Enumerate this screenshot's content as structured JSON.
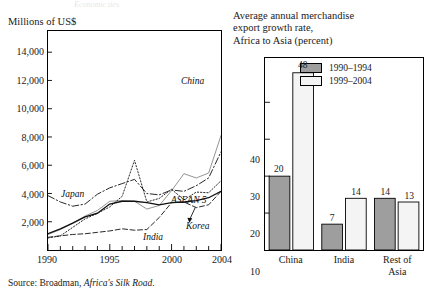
{
  "bleed_text": "Economic ties",
  "left": {
    "units_label": "Millions of US$",
    "xticks": [
      "1990",
      "1995",
      "2000",
      "2004"
    ],
    "yticks": [
      "14,000",
      "12,000",
      "10,000",
      "8,000",
      "6,000",
      "4,000",
      "2,000"
    ],
    "series_labels": {
      "china": "China",
      "japan": "Japan",
      "asean": "ASEAN 5",
      "india": "India",
      "korea": "Korea"
    }
  },
  "right": {
    "title_line1": "Average annual merchandise",
    "title_line2": "export growth rate,",
    "title_line3": "Africa to Asia (percent)",
    "yticks": [
      "40",
      "30",
      "20",
      "10"
    ],
    "legend": [
      {
        "label": "1990–1994",
        "color": "#9e9e9e"
      },
      {
        "label": "1999–2004",
        "color": "#f4f4f4"
      }
    ],
    "categories": [
      "China",
      "India",
      "Rest of\nAsia"
    ],
    "category_lines": [
      [
        "China"
      ],
      [
        "India"
      ],
      [
        "Rest of",
        "Asia"
      ]
    ]
  },
  "source": {
    "prefix": "Source: Broadman, ",
    "italic": "Africa's Silk Road",
    "suffix": "."
  },
  "chart_data": [
    {
      "type": "line",
      "title": "",
      "ylabel": "Millions of US$",
      "xlabel": "",
      "xlim": [
        1990,
        2004
      ],
      "ylim": [
        0,
        15500
      ],
      "yticks": [
        2000,
        4000,
        6000,
        8000,
        10000,
        12000,
        14000
      ],
      "xticks": [
        1990,
        1995,
        2000,
        2004
      ],
      "grid": false,
      "legend": "inline-annotations",
      "x": [
        1990,
        1991,
        1992,
        1993,
        1994,
        1995,
        1996,
        1997,
        1998,
        1999,
        2000,
        2001,
        2002,
        2003,
        2004
      ],
      "series": [
        {
          "name": "China",
          "style": "solid-thin-gray",
          "values": [
            1100,
            1450,
            1900,
            2400,
            2800,
            3450,
            3500,
            3450,
            2900,
            3150,
            4200,
            5400,
            5100,
            5450,
            8100
          ]
        },
        {
          "name": "Japan",
          "style": "dash-dot",
          "values": [
            3850,
            3400,
            3100,
            3250,
            3950,
            4400,
            4700,
            5000,
            4000,
            3900,
            4250,
            4150,
            4550,
            5100,
            6950
          ]
        },
        {
          "name": "ASEAN 5",
          "style": "dotted",
          "values": [
            850,
            1000,
            1600,
            2200,
            2600,
            3050,
            3800,
            6350,
            3400,
            3650,
            4300,
            3550,
            4100,
            4050,
            4900
          ]
        },
        {
          "name": "India",
          "style": "dashed",
          "values": [
            900,
            1000,
            1100,
            1150,
            1250,
            1350,
            1500,
            1400,
            1450,
            2300,
            3350,
            3400,
            3000,
            3200,
            4150
          ]
        },
        {
          "name": "Korea",
          "style": "solid-dark",
          "values": [
            1150,
            1500,
            1900,
            2350,
            2600,
            3250,
            3450,
            3450,
            3350,
            3200,
            3350,
            3400,
            3500,
            3700,
            4150
          ]
        }
      ],
      "annotations": [
        {
          "text": "China",
          "x": 2002.0,
          "y": 12150
        },
        {
          "text": "Japan",
          "x": 1991.1,
          "y": 4450
        },
        {
          "text": "ASEAN 5",
          "x": 2001.5,
          "y": 4050
        },
        {
          "text": "India",
          "x": 1998.7,
          "y": 1150
        },
        {
          "text": "Korea",
          "x": 2002.6,
          "y": 1950
        }
      ]
    },
    {
      "type": "bar",
      "title": "Average annual merchandise export growth rate, Africa to Asia (percent)",
      "xlabel": "",
      "ylabel": "",
      "ylim": [
        0,
        52
      ],
      "yticks": [
        10,
        20,
        30,
        40
      ],
      "grid": false,
      "legend_position": "top-right-inside",
      "categories": [
        "China",
        "India",
        "Rest of Asia"
      ],
      "series": [
        {
          "name": "1990–1994",
          "color": "#9e9e9e",
          "values": [
            20,
            7,
            14
          ]
        },
        {
          "name": "1999–2004",
          "color": "#f4f4f4",
          "values": [
            48,
            14,
            13
          ]
        }
      ]
    }
  ]
}
